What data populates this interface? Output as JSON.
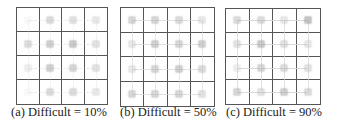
{
  "figure": {
    "panels": [
      {
        "label": "(a)",
        "caption": "(a) Difficult = 10%",
        "difficult_percent": 10,
        "grid_size": [
          4,
          4
        ],
        "marker_intensity": [
          [
            0.05,
            0.3,
            0.25,
            0.2
          ],
          [
            0.3,
            0.4,
            0.45,
            0.25
          ],
          [
            0.15,
            0.4,
            0.35,
            0.25
          ],
          [
            0.05,
            0.3,
            0.3,
            0.2
          ]
        ],
        "connections": "sparse"
      },
      {
        "label": "(b)",
        "caption": "(b) Difficult = 50%",
        "difficult_percent": 50,
        "grid_size": [
          4,
          4
        ],
        "marker_intensity": [
          [
            0.35,
            0.35,
            0.3,
            0.2
          ],
          [
            0.2,
            0.4,
            0.35,
            0.4
          ],
          [
            0.2,
            0.35,
            0.4,
            0.3
          ],
          [
            0.35,
            0.35,
            0.35,
            0.25
          ]
        ],
        "connections": "moderate"
      },
      {
        "label": "(c)",
        "caption": "(c) Difficult = 90%",
        "difficult_percent": 90,
        "grid_size": [
          4,
          4
        ],
        "marker_intensity": [
          [
            0.3,
            0.3,
            0.2,
            0.5
          ],
          [
            0.25,
            0.45,
            0.25,
            0.2
          ],
          [
            0.15,
            0.35,
            0.3,
            0.25
          ],
          [
            0.35,
            0.25,
            0.4,
            0.3
          ]
        ],
        "connections": "dense"
      }
    ],
    "colors": {
      "grid_line": "#555555",
      "marker": "#8c8c8c",
      "connection": "#d6d6d6",
      "caption_text": "#222222"
    }
  }
}
